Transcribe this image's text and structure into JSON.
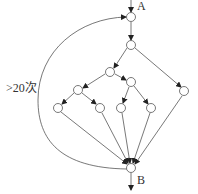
{
  "diagram": {
    "type": "flow-graph",
    "colors": {
      "stroke": "#555555",
      "node_fill": "#ffffff",
      "text": "#333333"
    },
    "labels": {
      "entry": "A",
      "exit": "B",
      "loop": ">20次"
    },
    "nodes": [
      {
        "id": "n1",
        "x": 131,
        "y": 17
      },
      {
        "id": "n2",
        "x": 131,
        "y": 45
      },
      {
        "id": "n3",
        "x": 110,
        "y": 72
      },
      {
        "id": "n4",
        "x": 131,
        "y": 82
      },
      {
        "id": "n5",
        "x": 184,
        "y": 91
      },
      {
        "id": "n6",
        "x": 78,
        "y": 90
      },
      {
        "id": "n7",
        "x": 58,
        "y": 108
      },
      {
        "id": "n8",
        "x": 100,
        "y": 108
      },
      {
        "id": "n9",
        "x": 121,
        "y": 108
      },
      {
        "id": "n10",
        "x": 151,
        "y": 108
      },
      {
        "id": "B",
        "x": 131,
        "y": 168
      }
    ],
    "edges": [
      [
        "n1",
        "n2"
      ],
      [
        "n2",
        "n3"
      ],
      [
        "n2",
        "n5"
      ],
      [
        "n3",
        "n6"
      ],
      [
        "n3",
        "n4"
      ],
      [
        "n6",
        "n7"
      ],
      [
        "n6",
        "n8"
      ],
      [
        "n4",
        "n9"
      ],
      [
        "n4",
        "n10"
      ],
      [
        "n7",
        "B"
      ],
      [
        "n8",
        "B"
      ],
      [
        "n9",
        "B"
      ],
      [
        "n10",
        "B"
      ],
      [
        "n5",
        "B"
      ],
      [
        "B",
        "n1",
        "loop"
      ]
    ]
  }
}
